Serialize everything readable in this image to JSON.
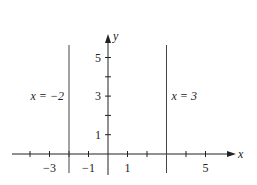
{
  "diagram": {
    "type": "coordinate-plane-vertical-lines",
    "x_axis": {
      "label": "x",
      "range": [
        -4,
        6.5
      ],
      "tick_values": [
        -4,
        -3,
        -2,
        -1,
        0,
        1,
        2,
        3,
        4,
        5
      ],
      "tick_labels": [
        {
          "value": -3,
          "text": "−3"
        },
        {
          "value": -1,
          "text": "−1"
        },
        {
          "value": 1,
          "text": "1"
        },
        {
          "value": 5,
          "text": "5"
        }
      ]
    },
    "y_axis": {
      "label": "y",
      "range": [
        -1,
        6
      ],
      "tick_values": [
        1,
        2,
        3,
        4,
        5
      ],
      "tick_labels": [
        {
          "value": 1,
          "text": "1"
        },
        {
          "value": 3,
          "text": "3"
        },
        {
          "value": 5,
          "text": "5"
        }
      ]
    },
    "lines": [
      {
        "name": "line-x-neg2",
        "x": -2,
        "label": "x = −2",
        "label_side": "left"
      },
      {
        "name": "line-x-3",
        "x": 3,
        "label": "x = 3",
        "label_side": "right"
      }
    ],
    "colors": {
      "axis": "#222222",
      "line": "#444444"
    }
  }
}
